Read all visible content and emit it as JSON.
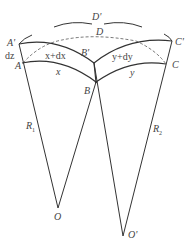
{
  "diagram": {
    "labels": {
      "A_prime": "A'",
      "A": "A",
      "dz": "dz",
      "x_plus_dx": "x+dx",
      "x": "x",
      "B_prime": "B'",
      "B": "B",
      "y_plus_dy": "y+dy",
      "y": "y",
      "C_prime": "C'",
      "C": "C",
      "D": "D",
      "D_prime": "D'",
      "R1": "R",
      "R1_sub": "1",
      "R2": "R",
      "R2_sub": "2",
      "O": "O",
      "O_prime": "O'"
    },
    "colors": {
      "stroke": "#333333",
      "text": "#444444"
    }
  }
}
